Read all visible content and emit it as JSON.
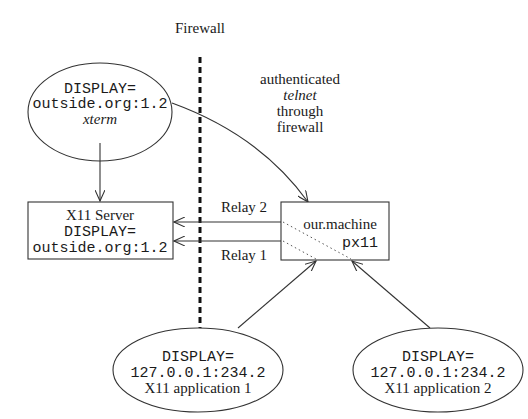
{
  "firewall": {
    "label": "Firewall"
  },
  "telnet_note": {
    "line1": "authenticated",
    "line2": "telnet",
    "line3": "through",
    "line4": "firewall"
  },
  "xterm_node": {
    "line1": "DISPLAY=",
    "line2": "outside.org:1.2",
    "line3": "xterm"
  },
  "x11_server": {
    "line1": "X11 Server",
    "line2": "DISPLAY=",
    "line3": "outside.org:1.2"
  },
  "machine": {
    "line1": "our.machine",
    "line2": "px11"
  },
  "relays": {
    "relay2": "Relay 2",
    "relay1": "Relay 1"
  },
  "app1": {
    "line1": "DISPLAY=",
    "line2": "127.0.0.1:234.2",
    "line3": "X11 application 1"
  },
  "app2": {
    "line1": "DISPLAY=",
    "line2": "127.0.0.1:234.2",
    "line3": "X11 application 2"
  },
  "colors": {
    "stroke": "#333333",
    "text": "#1a1a1a"
  }
}
